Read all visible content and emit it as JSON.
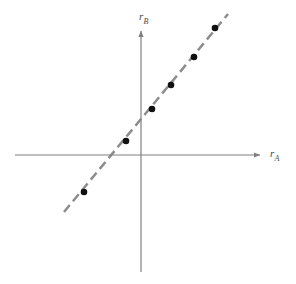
{
  "figure": {
    "width": 296,
    "height": 284,
    "background_color": "#ffffff"
  },
  "axes": {
    "color": "#808080",
    "stroke_width": 1.2,
    "origin": {
      "x": 141,
      "y": 155
    },
    "x_axis": {
      "name": "horizontal-axis",
      "x_start": 15,
      "x_end": 265,
      "y": 155,
      "arrow": "right",
      "label_symbol": "r",
      "label_subscript": "A"
    },
    "y_axis": {
      "name": "vertical-axis",
      "x": 141,
      "y_start": 272,
      "y_end": 26,
      "arrow": "up",
      "label_symbol": "r",
      "label_subscript": "B"
    }
  },
  "chart_data": {
    "type": "scatter",
    "title": "",
    "subtitle": "",
    "xlabel": "r_A",
    "ylabel": "r_B",
    "xlabel_symbol": "r",
    "xlabel_subscript": "A",
    "ylabel_symbol": "r",
    "ylabel_subscript": "B",
    "grid": false,
    "legend": null,
    "tick_labels_x": [],
    "tick_labels_y": [],
    "axis_style": "arrow-terminated quadrant axes through origin, no tick marks, no numeric scale",
    "points_pixel": [
      {
        "x": 84,
        "y": 192
      },
      {
        "x": 126,
        "y": 141
      },
      {
        "x": 152,
        "y": 109
      },
      {
        "x": 171,
        "y": 85
      },
      {
        "x": 194,
        "y": 57
      },
      {
        "x": 215,
        "y": 28
      }
    ],
    "x": [
      -4.75,
      -1.25,
      0.92,
      2.5,
      4.42,
      6.17
    ],
    "y": [
      -3.08,
      1.17,
      3.83,
      5.83,
      8.17,
      10.58
    ],
    "series": [
      {
        "name": "data points",
        "marker": "filled-circle",
        "marker_color": "#111111",
        "marker_radius": 3.3,
        "x": [
          -4.75,
          -1.25,
          0.92,
          2.5,
          4.42,
          6.17
        ],
        "y": [
          -3.08,
          1.17,
          3.83,
          5.83,
          8.17,
          10.58
        ]
      }
    ],
    "fit_line": {
      "name": "dashed trend line",
      "style": "dashed",
      "color": "#8c8c8c",
      "stroke_width": 2.5,
      "dash_length": 9,
      "gap_length": 5,
      "pixel_start": {
        "x": 64,
        "y": 212
      },
      "pixel_end": {
        "x": 228,
        "y": 14
      },
      "slope_screen": -1.207,
      "slope_data": 1.21,
      "intercept_data": 2.72,
      "passes_through_all_points": true
    },
    "xlim": [
      -10.5,
      10.33
    ],
    "ylim": [
      -9.75,
      10.75
    ]
  },
  "marker": {
    "color": "#111111",
    "radius": 3.3
  },
  "line": {
    "color": "#8c8c8c",
    "width": 2.5,
    "dasharray": "9 5"
  }
}
